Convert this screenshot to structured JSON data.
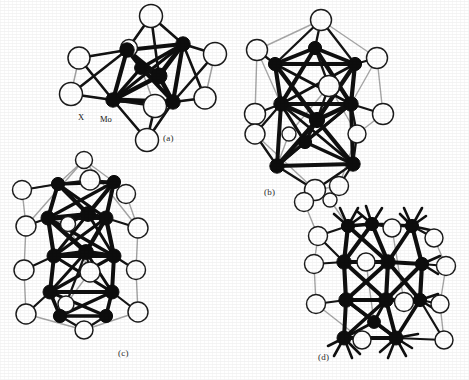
{
  "figure": {
    "background_color": "#ffffff",
    "width": 469,
    "height": 380,
    "ink_color": "#111111",
    "back_bond_color": "#9a9a9a",
    "atom_fill_dark": "#0d0d0d",
    "atom_fill_open": "#ffffff",
    "atom_stroke": "#1a1a1a"
  },
  "atom_labels": [
    {
      "id": "x-label",
      "text": "X",
      "x": 78,
      "y": 112
    },
    {
      "id": "mo-label",
      "text": "Mo",
      "x": 100,
      "y": 114
    }
  ],
  "panel_labels": [
    {
      "id": "panel-a-label",
      "text": "(a)",
      "x": 163,
      "y": 133
    },
    {
      "id": "panel-b-label",
      "text": "(b)",
      "x": 264,
      "y": 187
    },
    {
      "id": "panel-c-label",
      "text": "(c)",
      "x": 118,
      "y": 348
    },
    {
      "id": "panel-d-label",
      "text": "(d)",
      "x": 318,
      "y": 352
    }
  ],
  "panels": [
    {
      "id": "panel-a",
      "label": "(a)",
      "caption_label": "(a)",
      "x": 55,
      "y": 2,
      "w": 180,
      "h": 150,
      "description": "Mo6X8 octahedral cluster unit",
      "metal_atoms": [
        {
          "x": 72,
          "y": 48,
          "r": 7.2
        },
        {
          "x": 128,
          "y": 42,
          "r": 7.2
        },
        {
          "x": 104,
          "y": 74,
          "r": 8.0
        },
        {
          "x": 58,
          "y": 98,
          "r": 7.2
        },
        {
          "x": 118,
          "y": 100,
          "r": 7.2
        },
        {
          "x": 86,
          "y": 66,
          "r": 6.4
        }
      ],
      "ligand_atoms": [
        {
          "x": 96,
          "y": 14,
          "r": 11.5
        },
        {
          "x": 24,
          "y": 56,
          "r": 11.0
        },
        {
          "x": 160,
          "y": 52,
          "r": 11.5
        },
        {
          "x": 16,
          "y": 92,
          "r": 11.5
        },
        {
          "x": 150,
          "y": 96,
          "r": 11.0
        },
        {
          "x": 100,
          "y": 104,
          "r": 11.5
        },
        {
          "x": 92,
          "y": 138,
          "r": 11.5
        },
        {
          "x": 74,
          "y": 46,
          "r": 8.5
        }
      ]
    },
    {
      "id": "panel-b",
      "label": "(b)",
      "caption_label": "(b)",
      "x": 243,
      "y": 8,
      "w": 190,
      "h": 185,
      "description": "Mo9X11 bi-capped cluster unit",
      "metal_atoms": [
        {
          "x": 72,
          "y": 40,
          "r": 6.6
        },
        {
          "x": 32,
          "y": 56,
          "r": 6.6
        },
        {
          "x": 112,
          "y": 56,
          "r": 6.6
        },
        {
          "x": 38,
          "y": 96,
          "r": 7.2
        },
        {
          "x": 108,
          "y": 96,
          "r": 7.2
        },
        {
          "x": 74,
          "y": 112,
          "r": 7.6
        },
        {
          "x": 62,
          "y": 134,
          "r": 6.6
        },
        {
          "x": 34,
          "y": 158,
          "r": 7.2
        },
        {
          "x": 110,
          "y": 156,
          "r": 7.2
        }
      ],
      "ligand_atoms": [
        {
          "x": 78,
          "y": 12,
          "r": 10.5
        },
        {
          "x": 14,
          "y": 42,
          "r": 10.5
        },
        {
          "x": 134,
          "y": 50,
          "r": 10.5
        },
        {
          "x": 86,
          "y": 78,
          "r": 10.5
        },
        {
          "x": 12,
          "y": 106,
          "r": 10.5
        },
        {
          "x": 140,
          "y": 106,
          "r": 10.5
        },
        {
          "x": 12,
          "y": 126,
          "r": 10.0
        },
        {
          "x": 114,
          "y": 126,
          "r": 9.0
        },
        {
          "x": 46,
          "y": 126,
          "r": 7.0
        },
        {
          "x": 72,
          "y": 182,
          "r": 10.5
        },
        {
          "x": 96,
          "y": 178,
          "r": 9.5
        }
      ]
    },
    {
      "id": "panel-c",
      "label": "(c)",
      "caption_label": "(c)",
      "x": 14,
      "y": 158,
      "w": 165,
      "h": 200,
      "description": "Mo12X14 elongated tri-octahedral cluster chain unit",
      "metal_atoms": [
        {
          "x": 44,
          "y": 26,
          "r": 6.6
        },
        {
          "x": 100,
          "y": 24,
          "r": 6.6
        },
        {
          "x": 34,
          "y": 60,
          "r": 7.0
        },
        {
          "x": 74,
          "y": 56,
          "r": 7.4
        },
        {
          "x": 92,
          "y": 60,
          "r": 7.0
        },
        {
          "x": 40,
          "y": 98,
          "r": 7.0
        },
        {
          "x": 72,
          "y": 94,
          "r": 7.4
        },
        {
          "x": 100,
          "y": 98,
          "r": 7.0
        },
        {
          "x": 36,
          "y": 134,
          "r": 7.0
        },
        {
          "x": 98,
          "y": 134,
          "r": 7.0
        },
        {
          "x": 46,
          "y": 158,
          "r": 6.6
        },
        {
          "x": 92,
          "y": 158,
          "r": 6.6
        }
      ],
      "ligand_atoms": [
        {
          "x": 76,
          "y": 22,
          "r": 10.0
        },
        {
          "x": 8,
          "y": 32,
          "r": 9.5
        },
        {
          "x": 112,
          "y": 36,
          "r": 9.5
        },
        {
          "x": 12,
          "y": 68,
          "r": 10.0
        },
        {
          "x": 124,
          "y": 70,
          "r": 10.0
        },
        {
          "x": 54,
          "y": 66,
          "r": 7.5
        },
        {
          "x": 10,
          "y": 112,
          "r": 10.0
        },
        {
          "x": 122,
          "y": 112,
          "r": 9.5
        },
        {
          "x": 76,
          "y": 114,
          "r": 10.0
        },
        {
          "x": 52,
          "y": 146,
          "r": 8.0
        },
        {
          "x": 12,
          "y": 156,
          "r": 10.0
        },
        {
          "x": 124,
          "y": 154,
          "r": 10.0
        },
        {
          "x": 70,
          "y": 172,
          "r": 9.0
        },
        {
          "x": 70,
          "y": 2,
          "r": 8.5
        }
      ]
    },
    {
      "id": "panel-d",
      "label": "(d)",
      "caption_label": "(d)",
      "x": 300,
      "y": 200,
      "w": 165,
      "h": 178,
      "description": "Mo12X14 cluster with inter-cluster Mo-Mo bonds",
      "metal_atoms": [
        {
          "x": 48,
          "y": 26,
          "r": 6.6
        },
        {
          "x": 72,
          "y": 24,
          "r": 6.6
        },
        {
          "x": 112,
          "y": 26,
          "r": 6.6
        },
        {
          "x": 44,
          "y": 62,
          "r": 7.2
        },
        {
          "x": 88,
          "y": 62,
          "r": 7.2
        },
        {
          "x": 122,
          "y": 64,
          "r": 6.6
        },
        {
          "x": 46,
          "y": 100,
          "r": 7.2
        },
        {
          "x": 86,
          "y": 100,
          "r": 7.2
        },
        {
          "x": 120,
          "y": 100,
          "r": 6.6
        },
        {
          "x": 44,
          "y": 138,
          "r": 7.0
        },
        {
          "x": 96,
          "y": 138,
          "r": 7.0
        },
        {
          "x": 74,
          "y": 122,
          "r": 6.4
        }
      ],
      "ligand_atoms": [
        {
          "x": 18,
          "y": 36,
          "r": 9.5
        },
        {
          "x": 92,
          "y": 28,
          "r": 9.0
        },
        {
          "x": 134,
          "y": 38,
          "r": 9.0
        },
        {
          "x": 14,
          "y": 64,
          "r": 9.5
        },
        {
          "x": 66,
          "y": 62,
          "r": 9.0
        },
        {
          "x": 146,
          "y": 66,
          "r": 9.5
        },
        {
          "x": 16,
          "y": 104,
          "r": 9.5
        },
        {
          "x": 104,
          "y": 102,
          "r": 9.5
        },
        {
          "x": 140,
          "y": 104,
          "r": 9.0
        },
        {
          "x": 62,
          "y": 140,
          "r": 9.0
        },
        {
          "x": 144,
          "y": 140,
          "r": 9.0
        },
        {
          "x": 4,
          "y": 2,
          "r": 9.5
        },
        {
          "x": 30,
          "y": 0,
          "r": 7.0
        }
      ]
    }
  ]
}
